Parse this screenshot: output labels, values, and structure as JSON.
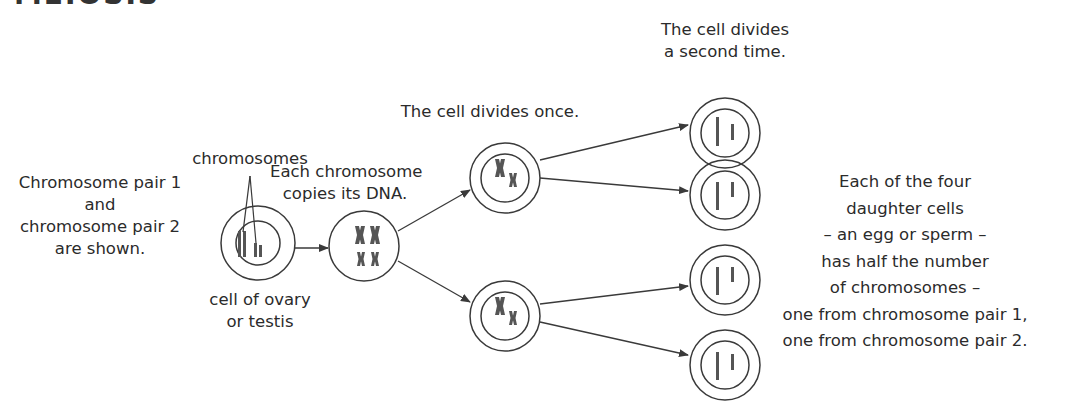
{
  "heading": "MEIOSIS",
  "labels": {
    "chromosome_pairs": [
      "Chromosome pair 1",
      "and",
      "chromosome pair 2",
      "are shown."
    ],
    "chromosomes": "chromosomes",
    "cell_origin": [
      "cell of ovary",
      "or testis"
    ],
    "copy_dna": [
      "Each chromosome",
      "copies its DNA."
    ],
    "divide_once": "The cell divides once.",
    "divide_twice": [
      "The cell divides",
      "a second time."
    ],
    "daughter_cells": [
      "Each of the four",
      "daughter cells",
      "– an egg or sperm –",
      "has half the number",
      "of chromosomes –",
      "one from chromosome pair 1,",
      "one from chromosome pair 2."
    ]
  },
  "stages": [
    {
      "id": "parent-cell",
      "description": "cell of ovary or testis with two chromosome pairs"
    },
    {
      "id": "replicated-cell",
      "description": "chromosomes copied (two large X, two small X)"
    },
    {
      "id": "first-division-cells",
      "count": 2,
      "description": "one large X and one small X each"
    },
    {
      "id": "daughter-cells",
      "count": 4,
      "description": "one long and one short chromatid each"
    }
  ],
  "colors": {
    "line": "#3a3a3a",
    "chromosome": "#555555",
    "text": "#2b2b2b"
  }
}
